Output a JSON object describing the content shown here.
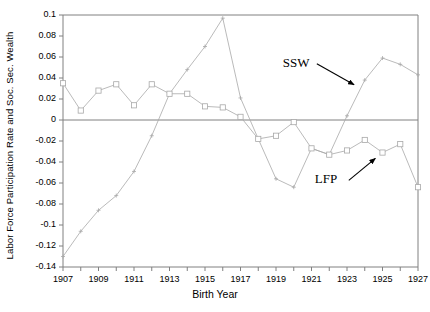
{
  "chart_data": {
    "type": "line",
    "title": "",
    "xlabel": "Birth Year",
    "ylabel": "Labor Force Participation Rate and Soc. Sec. Wealth",
    "x": [
      1907,
      1908,
      1909,
      1910,
      1911,
      1912,
      1913,
      1914,
      1915,
      1916,
      1917,
      1918,
      1919,
      1920,
      1921,
      1922,
      1923,
      1924,
      1925,
      1926,
      1927
    ],
    "xlim": [
      1907,
      1927
    ],
    "ylim": [
      -0.14,
      0.1
    ],
    "y_ticks": [
      0.1,
      0.08,
      0.06,
      0.04,
      0.02,
      0,
      -0.02,
      -0.04,
      -0.06,
      -0.08,
      -0.1,
      -0.12,
      -0.14
    ],
    "y_tick_labels": [
      "0.1",
      "0.08",
      "0.06",
      "0.04",
      "0.02",
      "0",
      "-0.02",
      "-0.04",
      "-0.06",
      "-0.08",
      "-0.1",
      "-0.12",
      "-0.14"
    ],
    "x_ticks": [
      1907,
      1908,
      1909,
      1910,
      1911,
      1912,
      1913,
      1914,
      1915,
      1916,
      1917,
      1918,
      1919,
      1920,
      1921,
      1922,
      1923,
      1924,
      1925,
      1926,
      1927
    ],
    "x_tick_labels_shown": [
      "1907",
      "1909",
      "1911",
      "1913",
      "1915",
      "1917",
      "1919",
      "1921",
      "1923",
      "1925",
      "1927"
    ],
    "x_tick_labels_values": [
      1907,
      1909,
      1911,
      1913,
      1915,
      1917,
      1919,
      1921,
      1923,
      1925,
      1927
    ],
    "grid": false,
    "zero_line": true,
    "legend_position": "inline-annotations",
    "series": [
      {
        "name": "SSW",
        "marker": "plus",
        "color": "#a8a8a8",
        "values": [
          -0.13,
          -0.106,
          -0.086,
          -0.072,
          -0.049,
          -0.015,
          0.025,
          0.048,
          0.07,
          0.097,
          0.021,
          -0.018,
          -0.056,
          -0.064,
          -0.027,
          -0.033,
          0.004,
          0.038,
          0.059,
          0.053,
          0.043
        ]
      },
      {
        "name": "LFP",
        "marker": "square",
        "color": "#a8a8a8",
        "values": [
          0.035,
          0.009,
          0.028,
          0.034,
          0.014,
          0.034,
          0.025,
          0.025,
          0.013,
          0.012,
          0.003,
          -0.018,
          -0.015,
          -0.002,
          -0.027,
          -0.033,
          -0.029,
          -0.019,
          -0.031,
          -0.023,
          -0.064
        ]
      }
    ],
    "annotations": [
      {
        "text": "SSW",
        "target_series": "SSW",
        "label_x": 1921.3,
        "label_y": 0.0535,
        "arrow_to_x": 1923.4,
        "arrow_to_y": 0.0335
      },
      {
        "text": "LFP",
        "target_series": "LFP",
        "label_x": 1923.1,
        "label_y": -0.0575,
        "arrow_to_x": 1924.6,
        "arrow_to_y": -0.0365
      }
    ]
  },
  "axis_title_x": "Birth Year",
  "axis_title_y": "Labor Force Participation Rate and Soc. Sec. Wealth"
}
